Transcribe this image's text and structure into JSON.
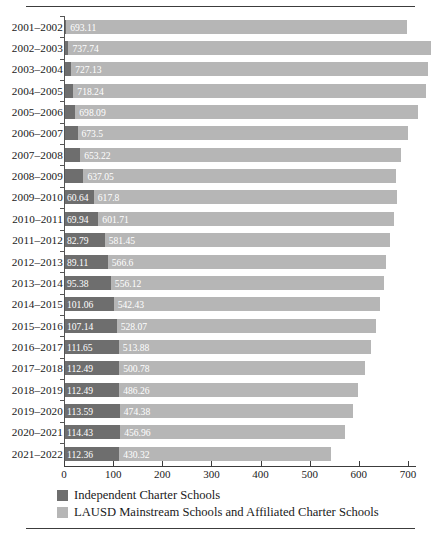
{
  "chart_data": {
    "type": "bar",
    "orientation": "horizontal",
    "stacked": true,
    "title": "",
    "subtitle": "",
    "xlabel": "",
    "ylabel": "",
    "xlim": [
      0,
      760
    ],
    "xticks": [
      0,
      100,
      200,
      300,
      400,
      500,
      600,
      700
    ],
    "xtick_labels": [
      "0",
      "100",
      "200",
      "300",
      "400",
      "500",
      "600",
      "700"
    ],
    "grid": false,
    "legend_position": "bottom-left",
    "categories": [
      "2001–2002",
      "2002–2003",
      "2003–2004",
      "2004–2005",
      "2005–2006",
      "2006–2007",
      "2007–2008",
      "2008–2009",
      "2009–2010",
      "2010–2011",
      "2011–2012",
      "2012–2013",
      "2013–2014",
      "2014–2015",
      "2015–2016",
      "2016–2017",
      "2017–2018",
      "2018–2019",
      "2019–2020",
      "2020–2021",
      "2021–2022"
    ],
    "series": [
      {
        "name": "Independent Charter Schools",
        "color": "#6e6e6e",
        "values": [
          4.5,
          9.0,
          14.5,
          19.0,
          23.0,
          27.5,
          33.0,
          39.5,
          60.64,
          69.94,
          82.79,
          89.11,
          95.38,
          101.06,
          107.14,
          111.65,
          112.49,
          112.49,
          113.59,
          114.43,
          112.36
        ],
        "labels": [
          "",
          "",
          "",
          "",
          "",
          "",
          "",
          "",
          "60.64",
          "69.94",
          "82.79",
          "89.11",
          "95.38",
          "101.06",
          "107.14",
          "111.65",
          "112.49",
          "112.49",
          "113.59",
          "114.43",
          "112.36"
        ]
      },
      {
        "name": "LAUSD Mainstream Schools and Affiliated Charter Schools",
        "color": "#b6b6b6",
        "values": [
          693.11,
          737.74,
          727.13,
          718.24,
          698.09,
          673.5,
          653.22,
          637.05,
          617.8,
          601.71,
          581.45,
          566.6,
          556.12,
          542.43,
          528.07,
          513.88,
          500.78,
          486.26,
          474.38,
          456.96,
          430.32
        ],
        "labels": [
          "693.11",
          "737.74",
          "727.13",
          "718.24",
          "698.09",
          "673.5",
          "653.22",
          "637.05",
          "617.8",
          "601.71",
          "581.45",
          "566.6",
          "556.12",
          "542.43",
          "528.07",
          "513.88",
          "500.78",
          "486.26",
          "474.38",
          "456.96",
          "430.32"
        ]
      }
    ],
    "legend": [
      {
        "label": "Independent Charter Schools",
        "color": "#6e6e6e"
      },
      {
        "label": "LAUSD Mainstream Schools and Affiliated Charter Schools",
        "color": "#b6b6b6"
      }
    ]
  }
}
